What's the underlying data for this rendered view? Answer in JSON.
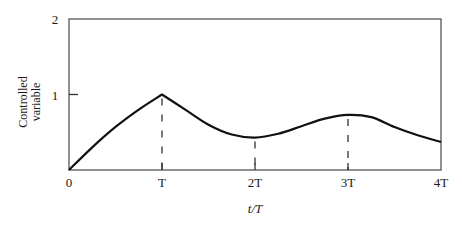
{
  "chart_data": {
    "type": "line",
    "title": "",
    "xlabel": "t/T",
    "ylabel": "Controlled variable",
    "ylabel_lines": [
      "Controlled",
      "variable"
    ],
    "x_ticks": [
      0,
      1,
      2,
      3,
      4
    ],
    "x_tick_labels": [
      "0",
      "T",
      "2T",
      "3T",
      "4T"
    ],
    "y_ticks": [
      1,
      2
    ],
    "y_tick_labels": [
      "1",
      "2"
    ],
    "xlim": [
      0,
      4
    ],
    "ylim": [
      0,
      2
    ],
    "grid": false,
    "legend": null,
    "series": [
      {
        "name": "Controlled variable",
        "x": [
          0,
          0.25,
          0.5,
          0.75,
          1.0,
          1.25,
          1.5,
          1.75,
          2.0,
          2.25,
          2.5,
          2.75,
          3.0,
          3.25,
          3.5,
          3.75,
          4.0
        ],
        "y": [
          0,
          0.3,
          0.57,
          0.8,
          1.0,
          0.8,
          0.6,
          0.47,
          0.43,
          0.48,
          0.58,
          0.68,
          0.73,
          0.7,
          0.57,
          0.46,
          0.37
        ]
      }
    ],
    "annotations": [
      {
        "type": "dashed-vertical",
        "x": 1,
        "from": 0,
        "to": 1.0
      },
      {
        "type": "dashed-vertical",
        "x": 2,
        "from": 0,
        "to": 0.43
      },
      {
        "type": "dashed-vertical",
        "x": 3,
        "from": 0,
        "to": 0.73
      }
    ]
  }
}
